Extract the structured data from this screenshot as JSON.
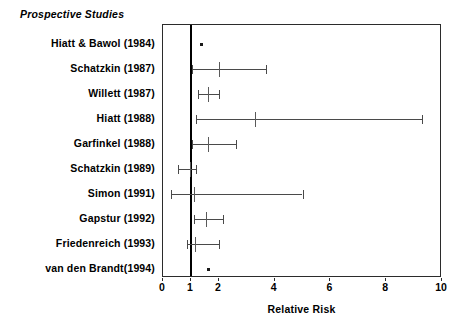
{
  "chart_data": {
    "type": "scatter",
    "title": "",
    "group_label": "Prospective Studies",
    "xlabel": "Relative Risk",
    "ylabel": "",
    "xlim": [
      0,
      10
    ],
    "xticks": [
      0,
      1,
      2,
      4,
      6,
      8,
      10
    ],
    "xticklabels": [
      "0",
      "1",
      "2",
      "4",
      "6",
      "8",
      "10"
    ],
    "grid": false,
    "legend": "none",
    "reference_line": 1,
    "studies": [
      {
        "label": "Hiatt & Bawol (1984)",
        "estimate": 1.35,
        "ci_low": null,
        "ci_high": null,
        "marker": "point-only"
      },
      {
        "label": "Schatzkin (1987)",
        "estimate": 2.0,
        "ci_low": 1.05,
        "ci_high": 3.7,
        "marker": "tick"
      },
      {
        "label": "Willett (1987)",
        "estimate": 1.6,
        "ci_low": 1.25,
        "ci_high": 2.0,
        "marker": "tick"
      },
      {
        "label": "Hiatt (1988)",
        "estimate": 3.3,
        "ci_low": 1.2,
        "ci_high": 9.3,
        "marker": "tick"
      },
      {
        "label": "Garfinkel (1988)",
        "estimate": 1.6,
        "ci_low": 1.05,
        "ci_high": 2.6,
        "marker": "tick"
      },
      {
        "label": "Schatzkin (1989)",
        "estimate": 0.95,
        "ci_low": 0.55,
        "ci_high": 1.2,
        "marker": "tick"
      },
      {
        "label": "Simon (1991)",
        "estimate": 1.1,
        "ci_low": 0.3,
        "ci_high": 5.0,
        "marker": "tick"
      },
      {
        "label": "Gapstur (1992)",
        "estimate": 1.55,
        "ci_low": 1.1,
        "ci_high": 2.15,
        "marker": "tick"
      },
      {
        "label": "Friedenreich (1993)",
        "estimate": 1.15,
        "ci_low": 0.85,
        "ci_high": 2.0,
        "marker": "tick"
      },
      {
        "label": "van den Brandt(1994)",
        "estimate": 1.6,
        "ci_low": null,
        "ci_high": null,
        "marker": "point-only"
      }
    ]
  },
  "colors": {
    "frame": "#2b2b2b",
    "reference_line": "#000000",
    "interval": "#4a4a4a",
    "marker": "#1a1a1a",
    "background": "#ffffff"
  }
}
